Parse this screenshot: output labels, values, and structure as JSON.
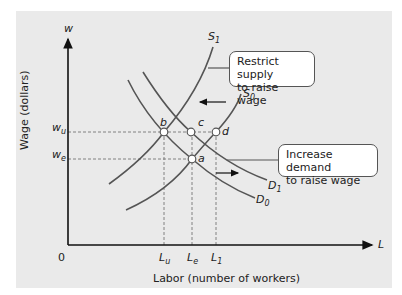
{
  "figure": {
    "y_axis_symbol": "w",
    "x_axis_symbol": "L",
    "y_axis_title": "Wage (dollars)",
    "x_axis_title": "Labor (number of workers)",
    "origin_label": "0",
    "y_ticks": [
      {
        "base": "w",
        "sub": "u"
      },
      {
        "base": "w",
        "sub": "e"
      }
    ],
    "x_ticks": [
      {
        "base": "L",
        "sub": "u"
      },
      {
        "base": "L",
        "sub": "e"
      },
      {
        "base": "L",
        "sub": "1"
      }
    ],
    "curves": {
      "S1": {
        "base": "S",
        "sub": "1"
      },
      "S0": {
        "base": "S",
        "sub": "0"
      },
      "D1": {
        "base": "D",
        "sub": "1"
      },
      "D0": {
        "base": "D",
        "sub": "0"
      }
    },
    "points": {
      "a": "a",
      "b": "b",
      "c": "c",
      "d": "d"
    },
    "callouts": {
      "restrict_supply": {
        "line1": "Restrict supply",
        "line2": "to raise wage"
      },
      "increase_demand": {
        "line1": "Increase demand",
        "line2": "to raise wage"
      }
    },
    "colors": {
      "background": "#eaeaea",
      "curve": "#555555",
      "axis": "#111111",
      "guide": "#777777",
      "callout_fill": "#ffffff"
    }
  }
}
